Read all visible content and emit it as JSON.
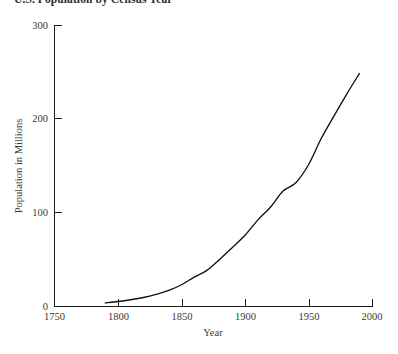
{
  "chart_data": {
    "type": "line",
    "title": "U.S. Population by Census Year",
    "xlabel": "Year",
    "ylabel": "Population in Millions",
    "xlim": [
      1750,
      2000
    ],
    "ylim": [
      0,
      300
    ],
    "xticks": [
      1750,
      1800,
      1850,
      1900,
      1950,
      2000
    ],
    "xticklabels": [
      "1750",
      "1800",
      "1850",
      "1900",
      "1950",
      "2000"
    ],
    "yticks": [
      0,
      100,
      200,
      300
    ],
    "yticklabels": [
      "0",
      "100",
      "200",
      "300"
    ],
    "grid": false,
    "legend": false,
    "line_color": "#111111",
    "series": [
      {
        "name": "U.S. Population",
        "x": [
          1790,
          1800,
          1810,
          1820,
          1830,
          1840,
          1850,
          1860,
          1870,
          1880,
          1890,
          1900,
          1910,
          1920,
          1930,
          1940,
          1950,
          1960,
          1970,
          1980,
          1990
        ],
        "values": [
          3.9,
          5.3,
          7.2,
          9.6,
          12.9,
          17.1,
          23.2,
          31.4,
          38.6,
          50.2,
          62.9,
          76.0,
          92.2,
          106.0,
          123.2,
          132.2,
          151.3,
          179.3,
          203.3,
          226.5,
          248.7
        ]
      }
    ]
  },
  "axes": {
    "x_tick_label_1750": "1750",
    "x_tick_label_1800": "1800",
    "x_tick_label_1850": "1850",
    "x_tick_label_1900": "1900",
    "x_tick_label_1950": "1950",
    "x_tick_label_2000": "2000",
    "y_tick_label_0": "0",
    "y_tick_label_100": "100",
    "y_tick_label_200": "200",
    "y_tick_label_300": "300"
  }
}
